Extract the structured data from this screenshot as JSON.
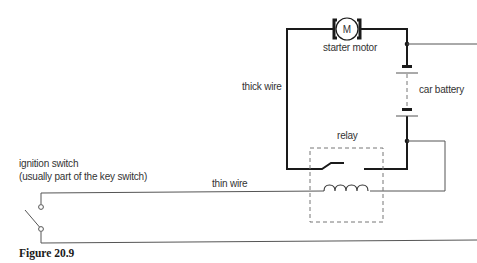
{
  "diagram": {
    "type": "circuit",
    "labels": {
      "motor_symbol": "M",
      "starter_motor": "starter motor",
      "car_battery": "car battery",
      "thick_wire": "thick wire",
      "relay": "relay",
      "thin_wire": "thin wire",
      "ignition_switch": "ignition switch",
      "ignition_switch_note": "(usually part of the key switch)"
    },
    "caption": "Figure 20.9",
    "colors": {
      "thick_wire": "#1a1a1a",
      "thin_wire": "#555555",
      "relay_box": "#777777",
      "background": "#ffffff"
    }
  }
}
